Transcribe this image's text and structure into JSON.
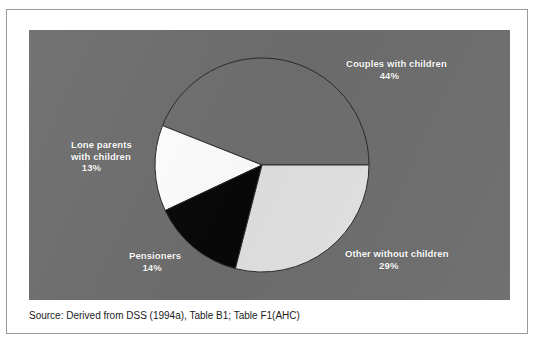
{
  "figure": {
    "panel_bg": "#6e6e6e",
    "frame_border": "#9a9a9a",
    "page_bg": "#ffffff"
  },
  "source": {
    "text": "Source:  Derived from DSS (1994a), Table B1; Table F1(AHC)"
  },
  "chart_data": {
    "type": "pie",
    "title": "",
    "subtitle": "",
    "xlabel": "",
    "ylabel": "",
    "legend_position": "none",
    "grid": false,
    "units": "percent",
    "total": 100,
    "start_angle_deg": 0,
    "direction": "counterclockwise",
    "categories": [
      "Couples with children",
      "Lone parents with children",
      "Pensioners",
      "Other without children"
    ],
    "values": [
      44,
      13,
      14,
      29
    ],
    "slices": [
      {
        "label": "Couples with children",
        "label_line1": "Couples with children",
        "value": 44,
        "value_text": "44%",
        "color": "#6f6f6f",
        "stroke": "#2a2a2a",
        "start_deg": 0,
        "end_deg": 158.4
      },
      {
        "label": "Lone parents with children",
        "label_line1": "Lone parents",
        "label_line2": "with children",
        "value": 13,
        "value_text": "13%",
        "color": "#ffffff",
        "stroke": "#2a2a2a",
        "start_deg": 158.4,
        "end_deg": 205.2
      },
      {
        "label": "Pensioners",
        "label_line1": "Pensioners",
        "value": 14,
        "value_text": "14%",
        "color": "#080808",
        "stroke": "#2a2a2a",
        "start_deg": 205.2,
        "end_deg": 255.6
      },
      {
        "label": "Other without children",
        "label_line1": "Other without children",
        "value": 29,
        "value_text": "29%",
        "color": "#e2e2e2",
        "stroke": "#2a2a2a",
        "start_deg": 255.6,
        "end_deg": 360
      }
    ],
    "geometry": {
      "center_x": 233,
      "center_y": 135,
      "radius": 107
    }
  }
}
